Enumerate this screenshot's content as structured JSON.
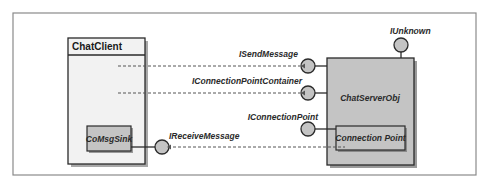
{
  "diagram": {
    "components": {
      "client": {
        "title": "ChatClient"
      },
      "sink": {
        "label": "CoMsgSink"
      },
      "server": {
        "label": "ChatServerObj"
      },
      "connection_point": {
        "label": "Connection Point"
      }
    },
    "interfaces": {
      "send_message": "ISendMessage",
      "cp_container": "IConnectionPointContainer",
      "unknown": "IUnknown",
      "connection_point": "IConnectionPoint",
      "receive_message": "IReceiveMessage"
    },
    "colors": {
      "frame": "#8a8a8a",
      "box_fill_light": "#f2f2f2",
      "box_fill_gray": "#c4c4c4",
      "stroke": "#2a2a2a",
      "shadow": "#9a9a9a",
      "dash": "#555555"
    }
  }
}
